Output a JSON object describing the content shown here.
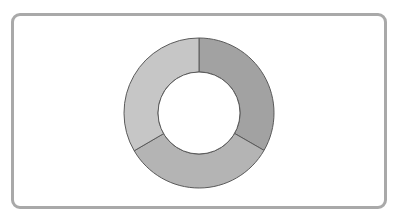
{
  "header": {
    "title_cutoff": ""
  },
  "colors": {
    "frame_border": "#a9a9a9",
    "segment_stroke": "#5a5a5a"
  },
  "chart_data": {
    "type": "pie",
    "variant": "donut",
    "title": "",
    "categories": [
      "Segment 1",
      "Segment 2",
      "Segment 3"
    ],
    "values": [
      33.3,
      33.3,
      33.4
    ],
    "colors": [
      "#a2a2a2",
      "#b4b4b4",
      "#c6c6c6"
    ],
    "start_angle_deg": 0,
    "direction": "clockwise",
    "legend": "none",
    "data_labels": "none",
    "center": [
      199,
      113
    ],
    "outer_radius": 75,
    "inner_radius": 41
  }
}
